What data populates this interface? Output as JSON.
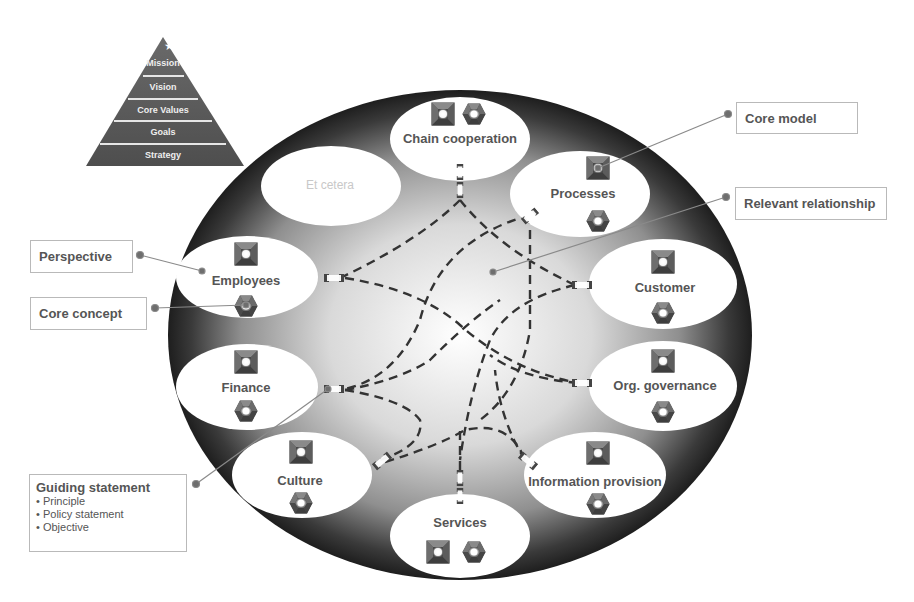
{
  "pyramid": {
    "top_icon": "star-icon",
    "levels": [
      "Mission",
      "Vision",
      "Core Values",
      "Goals",
      "Strategy"
    ],
    "color": "#5a5a5a"
  },
  "center_circle": {
    "outer_color": "#2a2a2a",
    "inner_color": "#ffffff"
  },
  "perspectives": [
    {
      "id": "chain-cooperation",
      "label": "Chain cooperation",
      "icons": [
        "core-model-square-icon",
        "core-concept-hexagon-icon"
      ]
    },
    {
      "id": "processes",
      "label": "Processes",
      "icons": [
        "core-model-square-icon",
        "core-concept-hexagon-icon"
      ]
    },
    {
      "id": "customer",
      "label": "Customer",
      "icons": [
        "core-model-square-icon",
        "core-concept-hexagon-icon"
      ]
    },
    {
      "id": "org-governance",
      "label": "Org. governance",
      "icons": [
        "core-model-square-icon",
        "core-concept-hexagon-icon"
      ]
    },
    {
      "id": "information-provision",
      "label": "Information provision",
      "icons": [
        "core-model-square-icon",
        "core-concept-hexagon-icon"
      ]
    },
    {
      "id": "services",
      "label": "Services",
      "icons": [
        "core-model-square-icon",
        "core-concept-hexagon-icon"
      ]
    },
    {
      "id": "culture",
      "label": "Culture",
      "icons": [
        "core-model-square-icon",
        "core-concept-hexagon-icon"
      ]
    },
    {
      "id": "finance",
      "label": "Finance",
      "icons": [
        "core-model-square-icon",
        "core-concept-hexagon-icon"
      ]
    },
    {
      "id": "employees",
      "label": "Employees",
      "icons": [
        "core-model-square-icon",
        "core-concept-hexagon-icon"
      ]
    },
    {
      "id": "et-cetera",
      "label": "Et cetera",
      "icons": []
    }
  ],
  "callouts": {
    "core_model": "Core model",
    "relevant_relationship": "Relevant relationship",
    "perspective": "Perspective",
    "core_concept": "Core concept",
    "guiding_statement": {
      "title": "Guiding statement",
      "items": [
        "Principle",
        "Policy statement",
        "Objective"
      ]
    }
  },
  "leader_color": "#8a8a8a",
  "dash_color": "#333333"
}
